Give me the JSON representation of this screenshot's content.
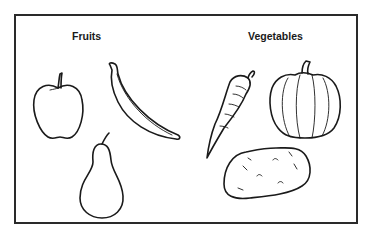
{
  "illustration": {
    "labels": {
      "fruits": "Fruits",
      "vegetables": "Vegetables"
    },
    "fruits": [
      "apple",
      "banana",
      "pear"
    ],
    "vegetables": [
      "carrot",
      "pumpkin",
      "potato"
    ],
    "colors": {
      "line": "#1a1a1a",
      "background": "#ffffff"
    }
  }
}
